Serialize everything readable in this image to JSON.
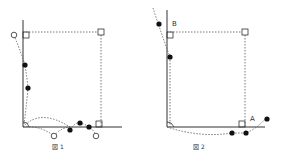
{
  "figures": [
    {
      "caption": "図 1",
      "labels": []
    },
    {
      "caption": "図 2",
      "labels": {
        "a": "A",
        "b": "B"
      }
    }
  ],
  "colors": {
    "line": "#333333",
    "dotted": "#555555",
    "fill": "#111111",
    "open": "#555555"
  }
}
